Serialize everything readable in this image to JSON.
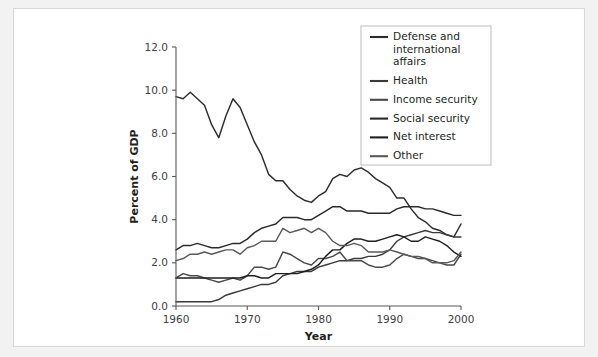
{
  "chart_data": {
    "type": "line",
    "title": "",
    "xlabel": "Year",
    "ylabel": "Percent of GDP",
    "xlim": [
      1960,
      2000
    ],
    "ylim": [
      0.0,
      12.0
    ],
    "xticks": [
      1960,
      1970,
      1980,
      1990,
      2000
    ],
    "xtick_labels": [
      "1960",
      "1970",
      "1980",
      "1990",
      "2000"
    ],
    "yticks": [
      0.0,
      2.0,
      4.0,
      6.0,
      8.0,
      10.0,
      12.0
    ],
    "ytick_labels": [
      "0.0",
      "2.0",
      "4.0",
      "6.0",
      "8.0",
      "10.0",
      "12.0"
    ],
    "grid": false,
    "legend_position": "top-right",
    "x": [
      1960,
      1961,
      1962,
      1963,
      1964,
      1965,
      1966,
      1967,
      1968,
      1969,
      1970,
      1971,
      1972,
      1973,
      1974,
      1975,
      1976,
      1977,
      1978,
      1979,
      1980,
      1981,
      1982,
      1983,
      1984,
      1985,
      1986,
      1987,
      1988,
      1989,
      1990,
      1991,
      1992,
      1993,
      1994,
      1995,
      1996,
      1997,
      1998,
      1999,
      2000
    ],
    "series": [
      {
        "name": "Defense and international affairs",
        "color": "#2d2d2d",
        "values": [
          9.7,
          9.6,
          9.9,
          9.6,
          9.3,
          8.4,
          7.8,
          8.8,
          9.6,
          9.2,
          8.4,
          7.6,
          7.0,
          6.1,
          5.8,
          5.8,
          5.4,
          5.1,
          4.9,
          4.8,
          5.1,
          5.3,
          5.9,
          6.1,
          6.0,
          6.3,
          6.4,
          6.2,
          5.9,
          5.7,
          5.5,
          5.0,
          5.0,
          4.5,
          4.1,
          3.9,
          3.6,
          3.5,
          3.3,
          3.2,
          3.8
        ]
      },
      {
        "name": "Health",
        "color": "#3a3a3a",
        "values": [
          0.2,
          0.2,
          0.2,
          0.2,
          0.2,
          0.2,
          0.3,
          0.5,
          0.6,
          0.7,
          0.8,
          0.9,
          1.0,
          1.0,
          1.1,
          1.4,
          1.5,
          1.6,
          1.6,
          1.6,
          1.8,
          1.9,
          2.0,
          2.1,
          2.1,
          2.2,
          2.2,
          2.3,
          2.3,
          2.4,
          2.6,
          3.0,
          3.2,
          3.3,
          3.4,
          3.5,
          3.4,
          3.4,
          3.3,
          3.2,
          3.2
        ]
      },
      {
        "name": "Income security",
        "color": "#4a4a4a",
        "values": [
          1.3,
          1.5,
          1.4,
          1.4,
          1.3,
          1.2,
          1.1,
          1.2,
          1.3,
          1.2,
          1.4,
          1.8,
          1.8,
          1.7,
          1.8,
          2.5,
          2.4,
          2.2,
          2.0,
          1.9,
          2.2,
          2.2,
          2.3,
          2.5,
          2.1,
          2.1,
          2.1,
          1.9,
          1.8,
          1.8,
          1.9,
          2.2,
          2.4,
          2.3,
          2.2,
          2.2,
          2.1,
          2.0,
          1.9,
          1.9,
          2.4
        ]
      },
      {
        "name": "Social security",
        "color": "#2a2a2a",
        "values": [
          2.6,
          2.8,
          2.8,
          2.9,
          2.8,
          2.7,
          2.7,
          2.8,
          2.9,
          2.9,
          3.1,
          3.4,
          3.6,
          3.7,
          3.8,
          4.1,
          4.1,
          4.1,
          4.0,
          4.0,
          4.2,
          4.4,
          4.6,
          4.6,
          4.4,
          4.4,
          4.4,
          4.3,
          4.3,
          4.3,
          4.3,
          4.5,
          4.6,
          4.6,
          4.6,
          4.5,
          4.5,
          4.4,
          4.3,
          4.2,
          4.2
        ]
      },
      {
        "name": "Net interest",
        "color": "#1f1f1f",
        "values": [
          1.3,
          1.3,
          1.3,
          1.3,
          1.3,
          1.3,
          1.3,
          1.3,
          1.3,
          1.3,
          1.4,
          1.4,
          1.3,
          1.3,
          1.5,
          1.5,
          1.5,
          1.5,
          1.6,
          1.7,
          1.9,
          2.3,
          2.6,
          2.6,
          2.9,
          3.1,
          3.1,
          3.0,
          3.0,
          3.1,
          3.2,
          3.3,
          3.2,
          3.0,
          3.0,
          3.2,
          3.1,
          3.0,
          2.8,
          2.5,
          2.3
        ]
      },
      {
        "name": "Other",
        "color": "#5a5a5a",
        "values": [
          2.1,
          2.2,
          2.4,
          2.4,
          2.5,
          2.4,
          2.5,
          2.6,
          2.6,
          2.4,
          2.7,
          2.8,
          3.0,
          3.0,
          3.0,
          3.6,
          3.4,
          3.5,
          3.6,
          3.4,
          3.6,
          3.4,
          3.0,
          2.8,
          2.8,
          2.9,
          2.8,
          2.5,
          2.5,
          2.5,
          2.6,
          2.5,
          2.4,
          2.3,
          2.3,
          2.2,
          2.0,
          2.0,
          2.0,
          2.1,
          2.5
        ]
      }
    ]
  },
  "legend": {
    "entries": [
      "Defense and international affairs",
      "Health",
      "Income security",
      "Social security",
      "Net interest",
      "Other"
    ]
  }
}
